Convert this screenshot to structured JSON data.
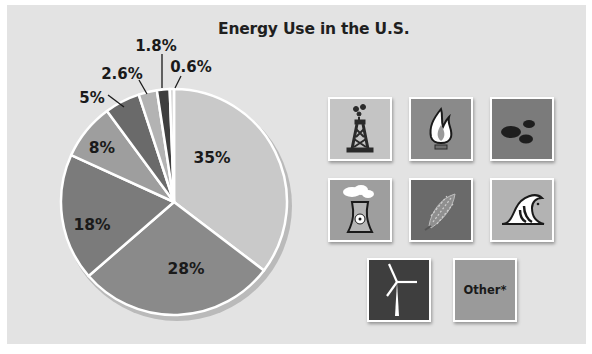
{
  "chart_data": {
    "type": "pie",
    "title": "Energy Use in the U.S.",
    "categories": [
      "Oil (petroleum)",
      "Natural gas",
      "Coal",
      "Nuclear",
      "Biomass",
      "Hydropower",
      "Wind",
      "Other*"
    ],
    "values": [
      35,
      28,
      18,
      8,
      5,
      2.6,
      1.8,
      0.6
    ],
    "labels": [
      "35%",
      "28%",
      "18%",
      "8%",
      "5%",
      "2.6%",
      "1.8%",
      "0.6%"
    ],
    "colors": [
      "#c9c9c9",
      "#8a8a8a",
      "#7b7b7b",
      "#9e9e9e",
      "#6a6a6a",
      "#b3b3b3",
      "#3e3e3e",
      "#d6d6d6"
    ],
    "legend_position": "right (icon tiles)",
    "legend_entries": [
      "oil-derrick",
      "gas-flame",
      "coal-lumps",
      "nuclear-cooling-tower",
      "corn",
      "ocean-wave",
      "wind-turbine",
      "Other*"
    ]
  },
  "title": "Energy Use in the U.S.",
  "slice_labels": {
    "oil": "35%",
    "gas": "28%",
    "coal": "18%",
    "nuclear": "8%",
    "biomass": "5%",
    "hydro": "2.6%",
    "wind": "1.8%",
    "other": "0.6%"
  },
  "legend": {
    "tiles": [
      {
        "icon": "oil-derrick-icon",
        "color": "#c4c4c4"
      },
      {
        "icon": "gas-flame-icon",
        "color": "#8a8a8a"
      },
      {
        "icon": "coal-icon",
        "color": "#7b7b7b"
      },
      {
        "icon": "nuclear-plant-icon",
        "color": "#9e9e9e"
      },
      {
        "icon": "corn-icon",
        "color": "#6a6a6a"
      },
      {
        "icon": "wave-icon",
        "color": "#b3b3b3"
      },
      {
        "icon": "wind-turbine-icon",
        "color": "#3e3e3e"
      },
      {
        "icon": "other",
        "color": "#9a9a9a",
        "label": "Other*"
      }
    ]
  }
}
